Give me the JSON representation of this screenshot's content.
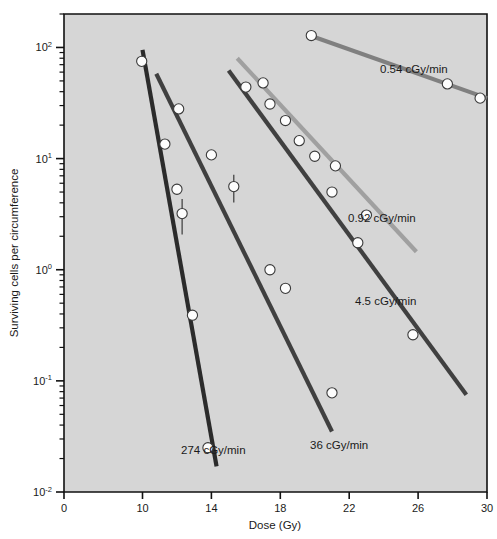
{
  "chart_data": {
    "type": "line",
    "title": "",
    "xlabel": "Dose (Gy)",
    "ylabel": "Surviving cells per circumference",
    "xlim": [
      0,
      30
    ],
    "ylim": [
      0.01,
      200
    ],
    "yscale": "log",
    "xscale": "broken-linear",
    "grid": false,
    "legend_position": "inline-annotations",
    "plot_background": "#d6d6d6",
    "x_ticks": [
      "0",
      "10",
      "14",
      "18",
      "22",
      "26",
      "30"
    ],
    "x_tick_values": [
      0,
      10,
      14,
      18,
      22,
      26,
      30
    ],
    "y_ticks": [
      "10²",
      "10¹",
      "10⁰",
      "10⁻¹",
      "10⁻²"
    ],
    "y_tick_bases": [
      "10",
      "10",
      "10",
      "10",
      "10"
    ],
    "y_tick_exponents": [
      "2",
      "1",
      "0",
      "-1",
      "-2"
    ],
    "y_tick_values": [
      100,
      10,
      1,
      0.1,
      0.01
    ],
    "series": [
      {
        "name": "0.54 cGy/min",
        "label": "0.54 cGy/min",
        "color": "#808080",
        "line_start": [
          19.6,
          130
        ],
        "line_end": [
          30.0,
          35
        ],
        "points": [
          {
            "x": 19.8,
            "y": 128,
            "err": 0.0
          },
          {
            "x": 27.7,
            "y": 47
          },
          {
            "x": 29.6,
            "y": 35
          }
        ]
      },
      {
        "name": "0.92 cGy/min",
        "label": "0.92 cGy/min",
        "color": "#a0a0a0",
        "line_start": [
          15.5,
          80
        ],
        "line_end": [
          25.9,
          1.45
        ],
        "points": [
          {
            "x": 17.0,
            "y": 48
          },
          {
            "x": 19.1,
            "y": 14.5
          },
          {
            "x": 21.2,
            "y": 8.6
          },
          {
            "x": 23.0,
            "y": 3.1
          }
        ]
      },
      {
        "name": "4.5 cGy/min",
        "label": "4.5 cGy/min",
        "color": "#404040",
        "line_start": [
          15.0,
          62
        ],
        "line_end": [
          28.8,
          0.075
        ],
        "points": [
          {
            "x": 16.0,
            "y": 44
          },
          {
            "x": 17.4,
            "y": 31
          },
          {
            "x": 18.3,
            "y": 22
          },
          {
            "x": 20.0,
            "y": 10.5
          },
          {
            "x": 21.0,
            "y": 5.0
          },
          {
            "x": 22.5,
            "y": 1.75
          },
          {
            "x": 25.7,
            "y": 0.26
          }
        ]
      },
      {
        "name": "36 cGy/min",
        "label": "36 cGy/min",
        "color": "#404040",
        "line_start": [
          10.8,
          58
        ],
        "line_end": [
          21.0,
          0.035
        ],
        "points": [
          {
            "x": 12.1,
            "y": 28
          },
          {
            "x": 14.0,
            "y": 10.8
          },
          {
            "x": 15.3,
            "y": 5.6,
            "err": 0.28
          },
          {
            "x": 17.4,
            "y": 1.0
          },
          {
            "x": 18.3,
            "y": 0.68
          },
          {
            "x": 21.0,
            "y": 0.078
          }
        ]
      },
      {
        "name": "274 cGy/min",
        "label": "274 cGy/min",
        "color": "#2b2b2b",
        "line_start": [
          10.0,
          95
        ],
        "line_end": [
          14.3,
          0.017
        ],
        "points": [
          {
            "x": 9.9,
            "y": 75
          },
          {
            "x": 11.3,
            "y": 13.5
          },
          {
            "x": 12.0,
            "y": 5.3
          },
          {
            "x": 12.3,
            "y": 3.2,
            "err": 0.35
          },
          {
            "x": 12.9,
            "y": 0.39
          },
          {
            "x": 13.8,
            "y": 0.025
          }
        ]
      }
    ],
    "annotations": [
      {
        "text": "0.54 cGy/min",
        "x": 380,
        "y": 73
      },
      {
        "text": "0.92 cGy/min",
        "x": 348,
        "y": 222
      },
      {
        "text": "4.5 cGy/min",
        "x": 355,
        "y": 305
      },
      {
        "text": "36 cGy/min",
        "x": 310,
        "y": 449
      },
      {
        "text": "274 cGy/min",
        "x": 181,
        "y": 454
      }
    ]
  },
  "axes": {
    "x_title": "Dose (Gy)",
    "y_title": "Surviving cells per circumference"
  }
}
